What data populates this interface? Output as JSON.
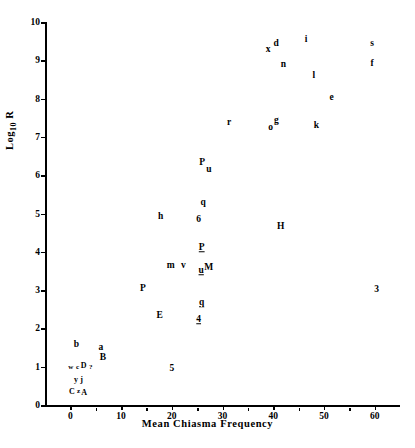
{
  "chart_data": {
    "type": "scatter",
    "title": "",
    "xlabel": "Mean Chiasma Frequency",
    "ylabel": "Log 10 R",
    "ylabel_base": "Log",
    "ylabel_sub": "10",
    "ylabel_tail": "R",
    "xlim": [
      -5,
      65
    ],
    "ylim": [
      0,
      10
    ],
    "xticks": [
      0,
      10,
      20,
      30,
      40,
      50,
      60
    ],
    "xtick_labels": [
      "0",
      "10",
      "20",
      "30",
      "40",
      "50",
      "60"
    ],
    "x_minor_ticks": [
      5,
      15,
      25,
      35,
      45,
      55
    ],
    "yticks": [
      0,
      1,
      2,
      3,
      4,
      5,
      6,
      7,
      8,
      9,
      10
    ],
    "ytick_labels": [
      "0",
      "1",
      "2",
      "3",
      "4",
      "5",
      "6",
      "7",
      "8",
      "9",
      "10"
    ],
    "grid": false,
    "legend": false,
    "marker_style": "text-label",
    "points": [
      {
        "label": "x",
        "x": 39.0,
        "y": 9.28,
        "style": "normal"
      },
      {
        "label": "d",
        "x": 40.6,
        "y": 9.42,
        "style": "normal"
      },
      {
        "label": "i",
        "x": 46.5,
        "y": 9.53,
        "style": "normal"
      },
      {
        "label": "s",
        "x": 59.5,
        "y": 9.42,
        "style": "normal"
      },
      {
        "label": "n",
        "x": 42.0,
        "y": 8.87,
        "style": "normal"
      },
      {
        "label": "f",
        "x": 59.5,
        "y": 8.9,
        "style": "normal"
      },
      {
        "label": "l",
        "x": 48.0,
        "y": 8.6,
        "style": "normal"
      },
      {
        "label": "e",
        "x": 51.5,
        "y": 8.02,
        "style": "normal"
      },
      {
        "label": "r",
        "x": 31.3,
        "y": 7.35,
        "style": "normal"
      },
      {
        "label": "o",
        "x": 39.5,
        "y": 7.22,
        "style": "normal"
      },
      {
        "label": "g",
        "x": 40.6,
        "y": 7.42,
        "style": "normal"
      },
      {
        "label": "k",
        "x": 48.5,
        "y": 7.28,
        "style": "normal"
      },
      {
        "label": "P",
        "x": 26.0,
        "y": 6.33,
        "style": "normal"
      },
      {
        "label": "u",
        "x": 27.3,
        "y": 6.13,
        "style": "normal"
      },
      {
        "label": "q",
        "x": 26.2,
        "y": 5.27,
        "style": "normal"
      },
      {
        "label": "6",
        "x": 25.3,
        "y": 4.82,
        "style": "normal"
      },
      {
        "label": "h",
        "x": 17.8,
        "y": 4.9,
        "style": "normal"
      },
      {
        "label": "H",
        "x": 41.5,
        "y": 4.65,
        "style": "normal"
      },
      {
        "label": "P",
        "x": 25.9,
        "y": 4.1,
        "style": "under"
      },
      {
        "label": "m",
        "x": 19.8,
        "y": 3.62,
        "style": "normal"
      },
      {
        "label": "v",
        "x": 22.3,
        "y": 3.63,
        "style": "normal"
      },
      {
        "label": "u",
        "x": 25.8,
        "y": 3.5,
        "style": "under"
      },
      {
        "label": "M",
        "x": 27.3,
        "y": 3.57,
        "style": "normal"
      },
      {
        "label": "P",
        "x": 14.3,
        "y": 3.02,
        "style": "normal"
      },
      {
        "label": "3",
        "x": 60.4,
        "y": 3.0,
        "style": "normal"
      },
      {
        "label": "q",
        "x": 25.9,
        "y": 2.67,
        "style": "under"
      },
      {
        "label": "E",
        "x": 17.6,
        "y": 2.33,
        "style": "normal"
      },
      {
        "label": "4",
        "x": 25.3,
        "y": 2.22,
        "style": "under"
      },
      {
        "label": "b",
        "x": 1.2,
        "y": 1.57,
        "style": "normal"
      },
      {
        "label": "a",
        "x": 6.0,
        "y": 1.48,
        "style": "normal"
      },
      {
        "label": "B",
        "x": 6.4,
        "y": 1.22,
        "style": "normal"
      },
      {
        "label": "5",
        "x": 20.0,
        "y": 0.95,
        "style": "normal"
      },
      {
        "label": "w",
        "x": 0.1,
        "y": 1.0,
        "style": "tiny"
      },
      {
        "label": "c",
        "x": 1.4,
        "y": 1.0,
        "style": "tiny"
      },
      {
        "label": "D",
        "x": 2.6,
        "y": 1.02,
        "style": "small"
      },
      {
        "label": "?",
        "x": 4.0,
        "y": 1.0,
        "style": "tiny"
      },
      {
        "label": "y",
        "x": 1.1,
        "y": 0.66,
        "style": "small"
      },
      {
        "label": "j",
        "x": 2.2,
        "y": 0.66,
        "style": "small"
      },
      {
        "label": "C",
        "x": 0.3,
        "y": 0.33,
        "style": "small"
      },
      {
        "label": "z",
        "x": 1.6,
        "y": 0.37,
        "style": "tiny"
      },
      {
        "label": "A",
        "x": 2.7,
        "y": 0.31,
        "style": "small"
      }
    ]
  },
  "figure": {
    "background_color": "#ffffff",
    "axis_color": "#000000",
    "text_color": "#000000"
  }
}
